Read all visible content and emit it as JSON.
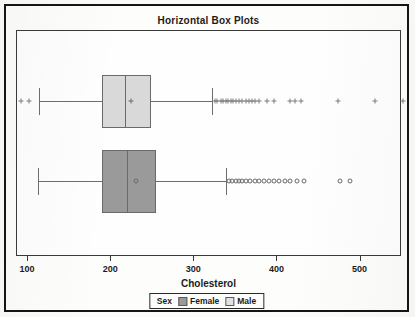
{
  "title": "Horizontal Box Plots",
  "axis": {
    "label": "Cholesterol",
    "ticks": [
      100,
      200,
      300,
      400,
      500
    ],
    "tick_labels": [
      "100",
      "200",
      "300",
      "400",
      "500"
    ],
    "min": 95,
    "max": 570
  },
  "legend": {
    "title": "Sex",
    "entries": [
      {
        "label": "Female",
        "color": "#9a9a9a"
      },
      {
        "label": "Male",
        "color": "#e2e2e2"
      }
    ]
  },
  "colors": {
    "male_box": "#d9d9d9",
    "female_box": "#9a9a9a",
    "outline": "#6a6a6a",
    "frame": "#151515",
    "text": "#1b1b1b"
  },
  "chart_data": {
    "type": "box",
    "title": "Horizontal Box Plots",
    "xlabel": "Cholesterol",
    "ylabel": "",
    "orientation": "horizontal",
    "xlim": [
      95,
      570
    ],
    "grid": false,
    "legend_position": "bottom",
    "groups": [
      "Male",
      "Female"
    ],
    "boxes": [
      {
        "name": "Male",
        "row": 0,
        "marker": "plus",
        "fill": "#d9d9d9",
        "whisker_low": 122,
        "q1": 198,
        "median": 225,
        "q3": 256,
        "whisker_high": 330,
        "mean": 232,
        "outliers_low": [
          100,
          110
        ],
        "outliers_high": [
          333,
          336,
          340,
          343,
          346,
          349,
          352,
          355,
          358,
          362,
          366,
          370,
          374,
          378,
          382,
          386,
          396,
          404,
          423,
          430,
          437,
          481,
          526,
          560
        ]
      },
      {
        "name": "Female",
        "row": 1,
        "marker": "circle",
        "fill": "#9a9a9a",
        "whisker_low": 121,
        "q1": 198,
        "median": 228,
        "q3": 262,
        "whisker_high": 347,
        "mean": 238,
        "outliers_low": [],
        "outliers_high": [
          350,
          354,
          358,
          362,
          366,
          371,
          376,
          381,
          386,
          392,
          398,
          404,
          410,
          417,
          424,
          432,
          440,
          484,
          496
        ]
      }
    ]
  }
}
